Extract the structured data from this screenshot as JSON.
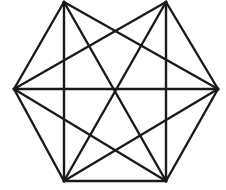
{
  "diagram": {
    "type": "graph",
    "shape": "hexagon-with-diagonals",
    "stroke_color": "#1a1a1a",
    "stroke_width": 2.4,
    "background": "#ffffff",
    "vertices": [
      {
        "id": "A",
        "position": "top-left",
        "x": 64,
        "y": 2
      },
      {
        "id": "B",
        "position": "top-right",
        "x": 166,
        "y": 2
      },
      {
        "id": "C",
        "position": "right",
        "x": 218,
        "y": 89
      },
      {
        "id": "D",
        "position": "bottom-right",
        "x": 166,
        "y": 181
      },
      {
        "id": "E",
        "position": "bottom-left",
        "x": 64,
        "y": 181
      },
      {
        "id": "F",
        "position": "left",
        "x": 14,
        "y": 89
      }
    ],
    "edges": [
      [
        "A",
        "F"
      ],
      [
        "A",
        "E"
      ],
      [
        "A",
        "D"
      ],
      [
        "A",
        "C"
      ],
      [
        "B",
        "C"
      ],
      [
        "B",
        "D"
      ],
      [
        "B",
        "E"
      ],
      [
        "B",
        "F"
      ],
      [
        "F",
        "C"
      ],
      [
        "F",
        "E"
      ],
      [
        "F",
        "D"
      ],
      [
        "C",
        "D"
      ],
      [
        "C",
        "E"
      ],
      [
        "E",
        "D"
      ]
    ]
  }
}
